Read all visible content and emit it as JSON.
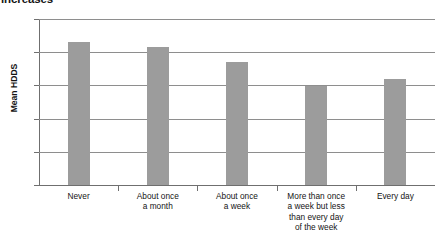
{
  "chart_data": {
    "type": "bar",
    "title": "increases",
    "title_note": "clipped at top edge of screenshot",
    "xlabel": "",
    "ylabel": "Mean HDDS",
    "categories": [
      "Never",
      "About once a month",
      "About once a week",
      "More than once a week but less than every day of the week",
      "Every day"
    ],
    "category_lines": [
      [
        "Never"
      ],
      [
        "About once",
        "a month"
      ],
      [
        "About once",
        "a week"
      ],
      [
        "More than once",
        "a week but less",
        "than every day",
        "of the week"
      ],
      [
        "Every day"
      ]
    ],
    "values": [
      4.3,
      4.15,
      3.7,
      2.97,
      3.2
    ],
    "ylim": [
      0,
      5
    ],
    "yticks": [
      "0",
      "1",
      "2",
      "3",
      "4",
      "5"
    ],
    "ytick_values": [
      0,
      1,
      2,
      3,
      4,
      5
    ],
    "grid": true,
    "legend": false,
    "bar_color": "#9c9c9c",
    "axis_color": "#6f6f6f",
    "grid_color": "#8e8e8e",
    "background": "#ffffff"
  }
}
